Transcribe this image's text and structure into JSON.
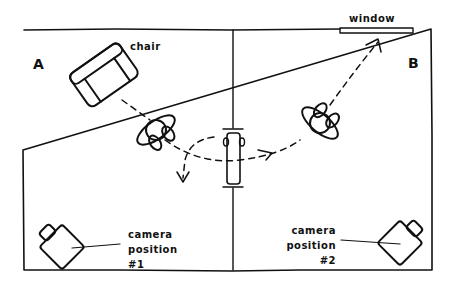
{
  "diagram": {
    "rooms": [
      {
        "id": "A",
        "label": "A"
      },
      {
        "id": "B",
        "label": "B"
      }
    ],
    "labels": {
      "chair": "chair",
      "window": "window",
      "camera1": [
        "camera",
        "position",
        "#1"
      ],
      "camera2": [
        "camera",
        "position",
        "#2"
      ]
    },
    "elements": [
      "room-wall",
      "center-divider",
      "doorway",
      "chair",
      "window",
      "person-a",
      "person-b",
      "camera-1",
      "camera-2",
      "motion-path"
    ]
  }
}
